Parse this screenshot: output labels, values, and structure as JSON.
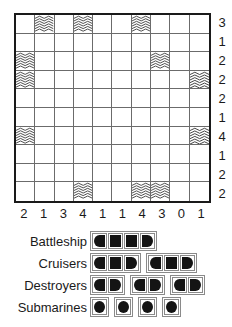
{
  "puzzle": {
    "title": "Battleships puzzle grid",
    "grid": {
      "rows": 10,
      "cols": 10,
      "water_icon": "wave-icon",
      "cells": [
        [
          0,
          1,
          0,
          1,
          0,
          0,
          1,
          0,
          0,
          0
        ],
        [
          0,
          0,
          0,
          0,
          0,
          0,
          0,
          0,
          0,
          0
        ],
        [
          1,
          0,
          0,
          0,
          0,
          0,
          0,
          1,
          0,
          0
        ],
        [
          1,
          0,
          0,
          0,
          0,
          0,
          0,
          0,
          0,
          1
        ],
        [
          0,
          0,
          0,
          0,
          0,
          0,
          0,
          0,
          0,
          0
        ],
        [
          0,
          0,
          0,
          0,
          0,
          0,
          0,
          0,
          0,
          0
        ],
        [
          1,
          0,
          0,
          0,
          0,
          0,
          0,
          0,
          0,
          1
        ],
        [
          0,
          0,
          0,
          0,
          0,
          0,
          0,
          0,
          0,
          0
        ],
        [
          0,
          0,
          0,
          0,
          0,
          0,
          0,
          0,
          0,
          0
        ],
        [
          0,
          0,
          0,
          1,
          0,
          0,
          1,
          1,
          0,
          0
        ]
      ]
    },
    "row_clues": [
      "3",
      "1",
      "2",
      "2",
      "2",
      "1",
      "4",
      "1",
      "2",
      "2"
    ],
    "col_clues": [
      "2",
      "1",
      "3",
      "4",
      "1",
      "1",
      "4",
      "3",
      "0",
      "1"
    ],
    "colors": {
      "border": "#1a1a1a",
      "gridline": "#6b6b6b",
      "ship_fill": "#141414",
      "background": "#ffffff"
    }
  },
  "fleet": {
    "rows": [
      {
        "label": "Battleship",
        "ships": [
          4
        ]
      },
      {
        "label": "Cruisers",
        "ships": [
          3,
          3
        ]
      },
      {
        "label": "Destroyers",
        "ships": [
          2,
          2,
          2
        ]
      },
      {
        "label": "Submarines",
        "ships": [
          1,
          1,
          1,
          1
        ]
      }
    ]
  }
}
